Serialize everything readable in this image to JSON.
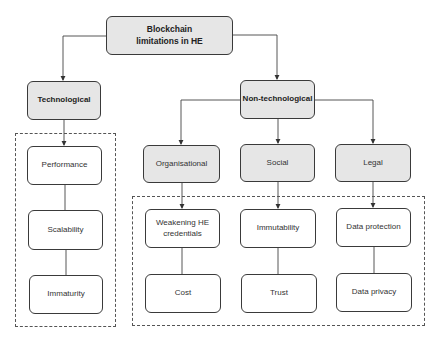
{
  "diagram": {
    "root": "Blockchain limitations in HE",
    "categories": {
      "technological": "Technological",
      "non_technological": "Non-technological"
    },
    "subcategories": {
      "organisational": "Organisational",
      "social": "Social",
      "legal": "Legal"
    },
    "technological_items": [
      "Performance",
      "Scalability",
      "Immaturity"
    ],
    "organisational_items": [
      "Weakening HE credentials",
      "Cost"
    ],
    "social_items": [
      "Immutability",
      "Trust"
    ],
    "legal_items": [
      "Data protection",
      "Data privacy"
    ],
    "colors": {
      "shaded_fill": "#e6e6e6",
      "stroke": "#3a3a3a"
    }
  }
}
